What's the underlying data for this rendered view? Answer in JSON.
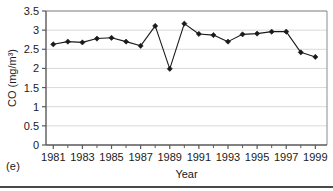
{
  "figure": {
    "panel_label": "(e)"
  },
  "chart_data": {
    "type": "line",
    "title": "",
    "xlabel": "Year",
    "ylabel": "CO (mg/m³)",
    "x": [
      1981,
      1982,
      1983,
      1984,
      1985,
      1986,
      1987,
      1988,
      1989,
      1990,
      1991,
      1992,
      1993,
      1994,
      1995,
      1996,
      1997,
      1998,
      1999
    ],
    "values": [
      2.63,
      2.7,
      2.68,
      2.78,
      2.8,
      2.7,
      2.59,
      3.11,
      1.99,
      3.17,
      2.9,
      2.87,
      2.7,
      2.89,
      2.91,
      2.96,
      2.96,
      2.42,
      2.3
    ],
    "xlim": [
      1980.5,
      1999.8
    ],
    "ylim": [
      0,
      3.5
    ],
    "ytick_labels": [
      "0",
      "0.5",
      "1",
      "1.5",
      "2",
      "2.5",
      "3",
      "3.5"
    ],
    "ytick_values": [
      0,
      0.5,
      1,
      1.5,
      2,
      2.5,
      3,
      3.5
    ],
    "xtick_labels": [
      "1981",
      "1983",
      "1985",
      "1987",
      "1989",
      "1991",
      "1993",
      "1995",
      "1997",
      "1999"
    ],
    "xtick_values": [
      1981,
      1983,
      1985,
      1987,
      1989,
      1991,
      1993,
      1995,
      1997,
      1999
    ],
    "xminor_values": [
      1982,
      1984,
      1986,
      1988,
      1990,
      1992,
      1994,
      1996,
      1998
    ],
    "grid": "horizontal",
    "marker": "diamond",
    "series_color": "#1a1a1a",
    "grid_color": "#d9d9d9",
    "axis_color": "#595959",
    "legend": "none"
  }
}
